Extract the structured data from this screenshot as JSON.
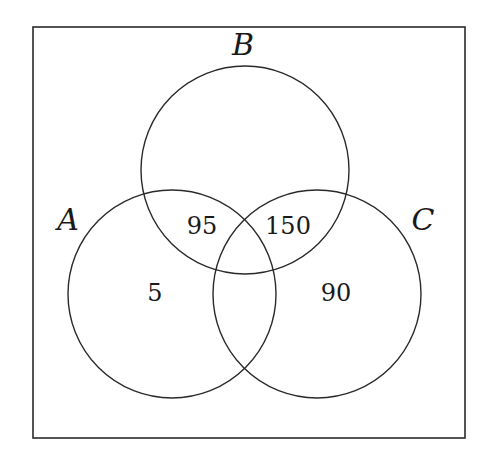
{
  "diagram": {
    "type": "venn",
    "colors": {
      "stroke": "#2a2a2a",
      "text": "#1a1a1a",
      "background": "#ffffff"
    },
    "universe": {
      "x": 33,
      "y": 27,
      "width": 432,
      "height": 411
    },
    "sets": [
      {
        "id": "A",
        "label": "A",
        "cx": 172,
        "cy": 294,
        "r": 104,
        "label_x": 68,
        "label_y": 230
      },
      {
        "id": "B",
        "label": "B",
        "cx": 245,
        "cy": 170,
        "r": 104,
        "label_x": 243,
        "label_y": 55
      },
      {
        "id": "C",
        "label": "C",
        "cx": 317,
        "cy": 294,
        "r": 104,
        "label_x": 423,
        "label_y": 230
      }
    ],
    "regions": [
      {
        "name": "A∩B only",
        "value": "95",
        "x": 202,
        "y": 234
      },
      {
        "name": "B∩C only",
        "value": "150",
        "x": 288,
        "y": 234
      },
      {
        "name": "A only",
        "value": "5",
        "x": 155,
        "y": 301
      },
      {
        "name": "C only",
        "value": "90",
        "x": 336,
        "y": 301
      }
    ]
  }
}
